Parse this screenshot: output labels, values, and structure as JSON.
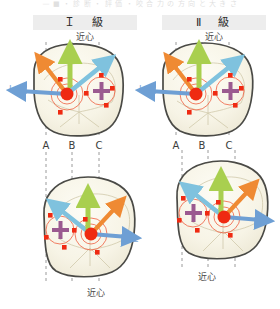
{
  "figure": {
    "top_partial_text": "—  ■  ・  診  断  ・  評  価  ・  咬  合  力  の  方  向  と  大  き  さ",
    "columns": [
      {
        "id": "class1",
        "label": "Ｉ　級"
      },
      {
        "id": "class2",
        "label": "Ⅱ　級"
      }
    ],
    "mesial_caption": "近心",
    "cusp_axis_labels": [
      "A",
      "B",
      "C"
    ],
    "direction_labels": {
      "lingual": "L",
      "mesial": "M",
      "palatal": "P"
    },
    "colors": {
      "orange": "#ef8a33",
      "green": "#a9cf4f",
      "blue": "#6e9fd4",
      "lightblue": "#7fc2de",
      "red": "#ef2a12",
      "purple": "#9b5a90",
      "tooth_outline": "#4a4a46",
      "tooth_fill": "#f6f3e7",
      "guide_dash": "#8a8a8a",
      "header_band": "#ededed"
    },
    "panels": [
      {
        "id": "upper-left-tooth",
        "name": "class1-upper-occlusal",
        "column": "class1",
        "top_caption": "近心",
        "axis_labels": [
          "A",
          "B",
          "C"
        ],
        "markers": {
          "lingual": "L",
          "palatal": "P",
          "mesial": "M"
        },
        "force_vectors": [
          {
            "color": "orange",
            "direction": "upper-left"
          },
          {
            "color": "green",
            "direction": "up"
          },
          {
            "color": "lightblue",
            "direction": "upper-right"
          },
          {
            "color": "blue",
            "direction": "left"
          }
        ],
        "cross_marker": "purple-plus",
        "contact_points": 6
      },
      {
        "id": "upper-right-tooth",
        "name": "class2-upper-occlusal",
        "column": "class2",
        "top_caption": "近心",
        "axis_labels": [
          "A",
          "B",
          "C"
        ],
        "markers": {
          "lingual": "L",
          "palatal": "P",
          "mesial": "M"
        },
        "force_vectors": [
          {
            "color": "orange",
            "direction": "upper-left"
          },
          {
            "color": "green",
            "direction": "up"
          },
          {
            "color": "lightblue",
            "direction": "upper-right"
          },
          {
            "color": "blue",
            "direction": "left"
          }
        ],
        "cross_marker": "purple-plus",
        "contact_points": 6
      },
      {
        "id": "lower-left-tooth",
        "name": "class1-lower-occlusal",
        "column": "class1",
        "bottom_caption": "近心",
        "markers": {
          "mesial": "M",
          "palatal": "P",
          "lingual": "L"
        },
        "force_vectors": [
          {
            "color": "lightblue",
            "direction": "upper-left"
          },
          {
            "color": "green",
            "direction": "up"
          },
          {
            "color": "orange",
            "direction": "upper-right"
          },
          {
            "color": "blue",
            "direction": "right"
          }
        ],
        "cross_marker": "purple-plus",
        "contact_points": 6
      },
      {
        "id": "lower-right-tooth",
        "name": "class2-lower-occlusal",
        "column": "class2",
        "bottom_caption": "近心",
        "markers": {
          "mesial": "M",
          "palatal": "P",
          "lingual": "L"
        },
        "force_vectors": [
          {
            "color": "lightblue",
            "direction": "upper-left"
          },
          {
            "color": "green",
            "direction": "up"
          },
          {
            "color": "orange",
            "direction": "upper-right"
          },
          {
            "color": "blue",
            "direction": "right"
          }
        ],
        "cross_marker": "purple-plus",
        "contact_points": 6
      }
    ]
  }
}
